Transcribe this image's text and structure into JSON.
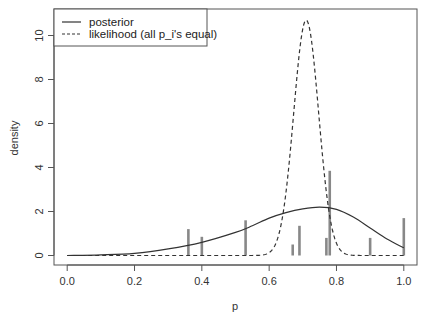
{
  "chart_data": {
    "type": "line",
    "title": "",
    "xlabel": "p",
    "ylabel": "density",
    "xlim": [
      0.0,
      1.0
    ],
    "ylim": [
      0,
      10.7
    ],
    "grid": false,
    "legend_position": "top-left",
    "x_ticks": [
      "0.0",
      "0.2",
      "0.4",
      "0.6",
      "0.8",
      "1.0"
    ],
    "y_ticks": [
      "0",
      "2",
      "4",
      "6",
      "8",
      "10"
    ],
    "legend": [
      {
        "label": "posterior",
        "style": "solid"
      },
      {
        "label": "likelihood (all p_i's equal)",
        "style": "dashed"
      }
    ],
    "series": [
      {
        "name": "posterior",
        "style": "solid",
        "x": [
          0.0,
          0.1,
          0.2,
          0.3,
          0.4,
          0.5,
          0.55,
          0.6,
          0.65,
          0.7,
          0.75,
          0.8,
          0.85,
          0.9,
          0.95,
          1.0
        ],
        "y": [
          0.0,
          0.03,
          0.1,
          0.3,
          0.6,
          1.05,
          1.35,
          1.7,
          1.95,
          2.12,
          2.2,
          2.1,
          1.75,
          1.25,
          0.75,
          0.35
        ]
      },
      {
        "name": "likelihood (all p_i's equal)",
        "style": "dashed",
        "peak_x": 0.71,
        "peak_y": 10.7,
        "sd": 0.037
      }
    ],
    "bars": {
      "name": "observed p_i",
      "x": [
        0.36,
        0.4,
        0.53,
        0.67,
        0.69,
        0.77,
        0.78,
        0.9,
        1.0
      ],
      "heights": [
        1.2,
        0.85,
        1.6,
        0.5,
        1.35,
        0.8,
        3.85,
        0.8,
        1.7
      ]
    }
  }
}
